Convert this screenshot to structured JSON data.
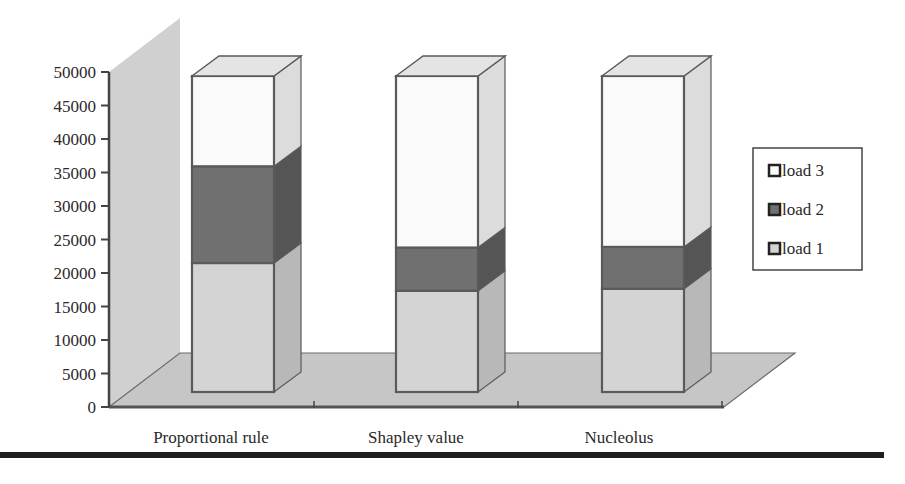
{
  "chart_data": {
    "type": "bar",
    "subtype": "3d-stacked-column",
    "title": "",
    "xlabel": "",
    "ylabel": "",
    "ylim": [
      0,
      50000
    ],
    "yticks": [
      0,
      5000,
      10000,
      15000,
      20000,
      25000,
      30000,
      35000,
      40000,
      45000,
      50000
    ],
    "categories": [
      "Proportional rule",
      "Shapley value",
      "Nucleolus"
    ],
    "series": [
      {
        "name": "load 1",
        "values": [
          20000,
          15700,
          16000
        ],
        "color": "#d2d2d2"
      },
      {
        "name": "load 2",
        "values": [
          15000,
          6700,
          6500
        ],
        "color": "#6e6e6e"
      },
      {
        "name": "load 3",
        "values": [
          14000,
          26600,
          26500
        ],
        "color": "#fafafa"
      }
    ],
    "legend": {
      "position": "right",
      "entries": [
        "load 3",
        "load 2",
        "load 1"
      ]
    },
    "grid": false
  },
  "axis": {
    "y_tick_labels": [
      "0",
      "5000",
      "10000",
      "15000",
      "20000",
      "25000",
      "30000",
      "35000",
      "40000",
      "45000",
      "50000"
    ]
  },
  "colors": {
    "wall": "#cfcfcf",
    "floor": "#c4c4c4",
    "outline": "#5a5a5a",
    "rule": "#1e1e1e"
  }
}
